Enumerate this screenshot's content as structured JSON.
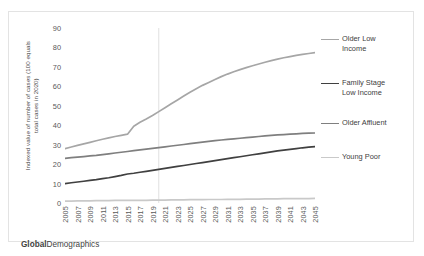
{
  "footer": {
    "brand_bold": "Global",
    "brand_rest": "Demographics"
  },
  "axis": {
    "ylabel": "Indexed value of number of cases (100 equals\ntotal cases in 2020)",
    "yticks": [
      0,
      10,
      20,
      30,
      40,
      50,
      60,
      70,
      80,
      90
    ],
    "xticks": [
      "2005",
      "2007",
      "2009",
      "2011",
      "2013",
      "2015",
      "2017",
      "2019",
      "2021",
      "2023",
      "2025",
      "2027",
      "2029",
      "2031",
      "2033",
      "2035",
      "2037",
      "2039",
      "2041",
      "2043",
      "2045"
    ]
  },
  "legend": [
    {
      "label": "Older Low\nIncome",
      "color": "#a6a6a6"
    },
    {
      "label": "Family Stage\nLow Income",
      "color": "#404040"
    },
    {
      "label": "Older Affluent",
      "color": "#7f7f7f"
    },
    {
      "label": "Young Poor",
      "color": "#c9c9c9"
    }
  ],
  "chart_data": {
    "type": "line",
    "title": "",
    "xlabel": "",
    "ylabel": "Indexed value of number of cases (100 equals total cases in 2020)",
    "ylim": [
      0,
      90
    ],
    "xlim": [
      2005,
      2045
    ],
    "grid": false,
    "vertical_gridline_at": 2020,
    "legend_position": "right",
    "x": [
      2005,
      2006,
      2007,
      2008,
      2009,
      2010,
      2011,
      2012,
      2013,
      2014,
      2015,
      2016,
      2017,
      2018,
      2019,
      2020,
      2021,
      2022,
      2023,
      2024,
      2025,
      2026,
      2027,
      2028,
      2029,
      2030,
      2031,
      2032,
      2033,
      2034,
      2035,
      2036,
      2037,
      2038,
      2039,
      2040,
      2041,
      2042,
      2043,
      2044,
      2045
    ],
    "series": [
      {
        "name": "Older Low Income",
        "color": "#a6a6a6",
        "values": [
          28.0,
          28.8,
          29.6,
          30.4,
          31.2,
          32.0,
          32.8,
          33.5,
          34.2,
          34.8,
          35.4,
          39.5,
          41.5,
          43.2,
          45.0,
          47.0,
          49.0,
          51.0,
          53.0,
          55.0,
          57.0,
          58.8,
          60.5,
          62.0,
          63.5,
          65.0,
          66.3,
          67.5,
          68.6,
          69.6,
          70.6,
          71.5,
          72.4,
          73.2,
          74.0,
          74.7,
          75.3,
          75.9,
          76.4,
          76.9,
          77.3
        ]
      },
      {
        "name": "Family Stage Low Income",
        "color": "#404040",
        "values": [
          10.0,
          10.4,
          10.8,
          11.2,
          11.6,
          12.0,
          12.5,
          13.0,
          13.6,
          14.2,
          14.9,
          15.3,
          15.8,
          16.3,
          16.8,
          17.3,
          17.8,
          18.3,
          18.8,
          19.3,
          19.8,
          20.3,
          20.8,
          21.3,
          21.8,
          22.3,
          22.8,
          23.3,
          23.8,
          24.3,
          24.8,
          25.3,
          25.8,
          26.3,
          26.8,
          27.2,
          27.6,
          28.0,
          28.4,
          28.7,
          29.0
        ]
      },
      {
        "name": "Older Affluent",
        "color": "#7f7f7f",
        "values": [
          23.0,
          23.3,
          23.6,
          23.9,
          24.2,
          24.5,
          24.9,
          25.3,
          25.7,
          26.1,
          26.5,
          26.9,
          27.3,
          27.7,
          28.1,
          28.5,
          28.9,
          29.3,
          29.7,
          30.1,
          30.5,
          30.9,
          31.3,
          31.7,
          32.1,
          32.4,
          32.7,
          33.0,
          33.3,
          33.6,
          33.9,
          34.2,
          34.5,
          34.8,
          35.0,
          35.2,
          35.4,
          35.6,
          35.8,
          35.9,
          36.0
        ]
      },
      {
        "name": "Young Poor",
        "color": "#c9c9c9",
        "values": [
          1.0,
          1.0,
          1.1,
          1.1,
          1.1,
          1.2,
          1.2,
          1.2,
          1.3,
          1.3,
          1.3,
          1.4,
          1.4,
          1.4,
          1.5,
          1.5,
          1.5,
          1.6,
          1.6,
          1.6,
          1.7,
          1.7,
          1.7,
          1.8,
          1.8,
          1.8,
          1.9,
          1.9,
          1.9,
          2.0,
          2.0,
          2.0,
          2.1,
          2.1,
          2.1,
          2.2,
          2.2,
          2.2,
          2.3,
          2.3,
          2.4
        ]
      }
    ]
  }
}
